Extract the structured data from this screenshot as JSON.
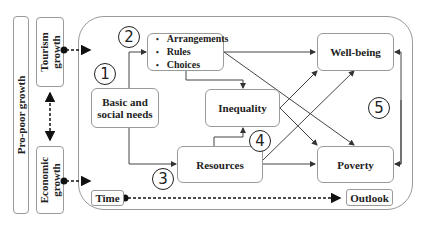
{
  "left": {
    "pro_poor": "Pro-poor growth",
    "tourism": "Tourism growth",
    "economic": "Economic growth"
  },
  "nodes": {
    "basic_needs": "Basic and social needs",
    "arrangements": [
      "Arrangements",
      "Rules",
      "Choices"
    ],
    "inequality": "Inequality",
    "resources": "Resources",
    "wellbeing": "Well-being",
    "poverty": "Poverty",
    "time": "Time",
    "outlook": "Outlook"
  },
  "markers": [
    "1",
    "2",
    "3",
    "4",
    "5"
  ]
}
